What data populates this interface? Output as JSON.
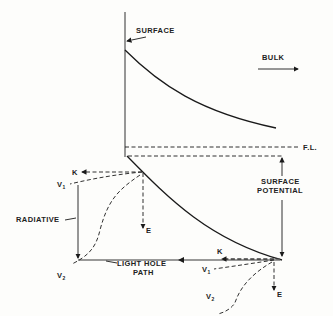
{
  "diagram": {
    "labels": {
      "surface": "SURFACE",
      "bulk": "BULK",
      "fermi_level": "F.L.",
      "surface_potential_line1": "SURFACE",
      "surface_potential_line2": "POTENTIAL",
      "radiative": "RADIATIVE",
      "light_hole_line1": "LIGHT HOLE",
      "light_hole_line2": "PATH",
      "k_left": "K",
      "k_right": "K",
      "v1_left": "V",
      "v1_left_sub": "1",
      "v2_left": "V",
      "v2_left_sub": "2",
      "v1_right": "V",
      "v1_right_sub": "1",
      "v2_right": "V",
      "v2_right_sub": "2",
      "e_left": "E",
      "e_right": "E"
    },
    "colors": {
      "ink": "#1a1a1a",
      "background": "#fdfdfb",
      "light_hole_path": "#777777"
    }
  }
}
